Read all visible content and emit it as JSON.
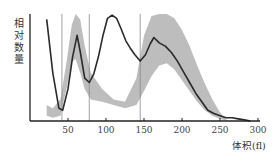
{
  "chart_data": {
    "type": "line",
    "title": "",
    "xlabel": "体积(fl)",
    "ylabel": "相对数量",
    "xlim": [
      0,
      300
    ],
    "ylim": [
      0,
      100
    ],
    "x_ticks": [
      50,
      100,
      150,
      200,
      250,
      300
    ],
    "grid": false,
    "reference_lines_x": [
      42,
      78,
      145
    ],
    "series": [
      {
        "name": "patient curve",
        "style": "dark line",
        "x": [
          22,
          30,
          38,
          43,
          50,
          56,
          62,
          66,
          72,
          78,
          84,
          90,
          96,
          102,
          108,
          114,
          120,
          126,
          132,
          138,
          145,
          152,
          158,
          163,
          170,
          178,
          186,
          194,
          202,
          210,
          218,
          226,
          234,
          242,
          250,
          258,
          266,
          274,
          282,
          290
        ],
        "y": [
          95,
          45,
          12,
          10,
          30,
          60,
          80,
          65,
          40,
          36,
          44,
          60,
          80,
          96,
          99,
          96,
          86,
          75,
          68,
          62,
          56,
          62,
          72,
          78,
          73,
          70,
          64,
          56,
          46,
          36,
          26,
          18,
          10,
          7,
          5,
          3,
          3,
          2,
          1,
          0
        ]
      },
      {
        "name": "normal reference band",
        "style": "gray shaded area",
        "x": [
          22,
          30,
          40,
          48,
          55,
          60,
          66,
          72,
          80,
          95,
          110,
          125,
          140,
          150,
          160,
          170,
          180,
          190,
          200,
          210,
          220,
          230,
          240,
          250,
          260
        ],
        "y_upper": [
          15,
          12,
          20,
          55,
          90,
          100,
          95,
          70,
          45,
          30,
          20,
          18,
          40,
          80,
          98,
          100,
          100,
          96,
          85,
          70,
          52,
          35,
          20,
          8,
          0
        ],
        "y_lower": [
          5,
          3,
          5,
          30,
          55,
          58,
          45,
          30,
          20,
          18,
          15,
          12,
          15,
          28,
          42,
          52,
          54,
          48,
          38,
          28,
          18,
          10,
          5,
          2,
          0
        ]
      }
    ]
  },
  "labels": {
    "ylabel": "相对数量",
    "xlabel": "体积(fl)",
    "ticks": [
      "50",
      "100",
      "150",
      "200",
      "250",
      "300"
    ]
  }
}
